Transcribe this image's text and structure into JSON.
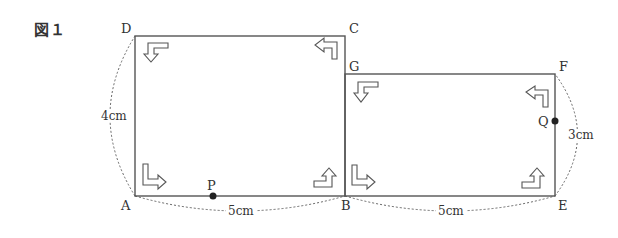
{
  "figure": {
    "title": "図１",
    "points": {
      "A": "A",
      "B": "B",
      "C": "C",
      "D": "D",
      "E": "E",
      "F": "F",
      "G": "G",
      "P": "P",
      "Q": "Q"
    },
    "measurements": {
      "AD": "4cm",
      "AB": "5cm",
      "BE": "5cm",
      "EF": "3cm"
    },
    "colors": {
      "line": "#555555",
      "point": "#222222",
      "text": "#333333"
    }
  }
}
